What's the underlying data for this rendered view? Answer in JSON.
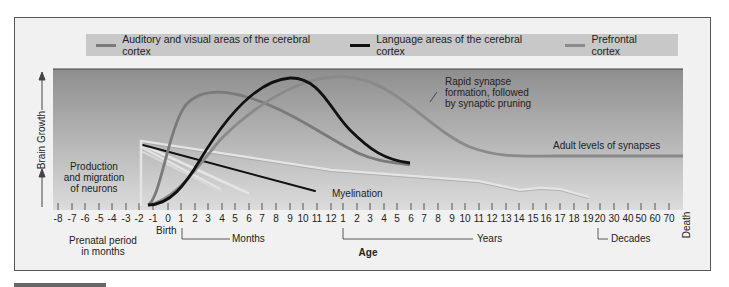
{
  "legend": {
    "items": [
      {
        "label": "Auditory and visual areas of the cerebral cortex",
        "color": "#7a7a7a"
      },
      {
        "label": "Language areas of the cerebral cortex",
        "color": "#111111"
      },
      {
        "label": "Prefrontal cortex",
        "color": "#8a8a8a"
      }
    ]
  },
  "axes": {
    "ylabel": "Brain Growth",
    "xlabel": "Age",
    "prenatal_label_line1": "Prenatal period",
    "prenatal_label_line2": "in months",
    "birth_label": "Birth",
    "months_label": "Months",
    "years_label": "Years",
    "decades_label": "Decades",
    "death_label": "Death"
  },
  "annotations": {
    "production_line1": "Production",
    "production_line2": "and migration",
    "production_line3": "of neurons",
    "synapse_line1": "Rapid synapse",
    "synapse_line2": "formation, followed",
    "synapse_line3": "by synaptic pruning",
    "adult_levels": "Adult levels of synapses",
    "myelination": "Myelination"
  },
  "chart_data": {
    "type": "line",
    "title": "",
    "xlabel": "Age",
    "ylabel": "Brain Growth",
    "tick_labels": [
      "-8",
      "-7",
      "-6",
      "-5",
      "-4",
      "-3",
      "-2",
      "-1",
      "0",
      "1",
      "2",
      "3",
      "4",
      "5",
      "6",
      "7",
      "8",
      "9",
      "10",
      "11",
      "12",
      "1",
      "2",
      "3",
      "4",
      "5",
      "6",
      "7",
      "8",
      "9",
      "10",
      "11",
      "12",
      "13",
      "14",
      "15",
      "16",
      "17",
      "18",
      "19",
      "20",
      "30",
      "40",
      "50",
      "60",
      "70"
    ],
    "tick_x": [
      58,
      72,
      85,
      99,
      112,
      126,
      139,
      153,
      168,
      181,
      195,
      208,
      222,
      235,
      249,
      262,
      276,
      290,
      303,
      317,
      331,
      343,
      357,
      370,
      384,
      397,
      411,
      424,
      438,
      452,
      465,
      479,
      492,
      506,
      519,
      533,
      546,
      560,
      574,
      588,
      600,
      614,
      628,
      641,
      655,
      669
    ],
    "segments": [
      {
        "name": "Prenatal period in months",
        "from": "-8",
        "to": "0"
      },
      {
        "name": "Months",
        "from": "1",
        "to": "12"
      },
      {
        "name": "Years",
        "from": "1",
        "to": "19"
      },
      {
        "name": "Decades",
        "from": "20",
        "to": "70"
      }
    ],
    "series": [
      {
        "name": "Auditory and visual areas of the cerebral cortex",
        "shape": "rises from ~-1 month, peaks ~4-5 months, declines to ~6 years"
      },
      {
        "name": "Language areas of the cerebral cortex",
        "shape": "rises from ~0, peaks ~9 months, declines to ~6 years"
      },
      {
        "name": "Prefrontal cortex",
        "shape": "rises from ~0, peaks ~1-2 years, declines to adult level by ~15 years, flat to 70"
      },
      {
        "name": "Myelination",
        "shape": "multiple declining straight lines from -2 months to ~4 months, ~6 months, ~11 months, and a long line to ~19 years"
      }
    ],
    "grid": false,
    "legend_position": "top"
  }
}
